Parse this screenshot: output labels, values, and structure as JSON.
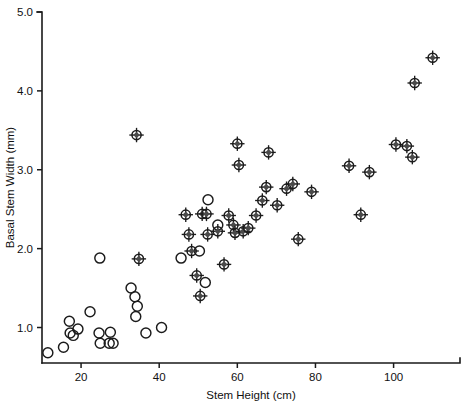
{
  "chart_data": {
    "type": "scatter",
    "title": "",
    "xlabel": "Stem Height (cm)",
    "ylabel": "Basal Stem Width (mm)",
    "xlim": [
      10,
      117
    ],
    "ylim": [
      0.55,
      5.0
    ],
    "xticks": [
      20,
      40,
      60,
      80,
      100
    ],
    "xtick_labels": [
      "20",
      "40",
      "60",
      "80",
      "100"
    ],
    "yticks": [
      1.0,
      2.0,
      3.0,
      4.0,
      5.0
    ],
    "ytick_labels": [
      "1.0",
      "2.0",
      "3.0",
      "4.0",
      "5.0"
    ],
    "grid": false,
    "legend": "none",
    "series": [
      {
        "name": "open-circle",
        "marker": "open circle",
        "points": [
          [
            11.5,
            0.68
          ],
          [
            15.5,
            0.75
          ],
          [
            17.0,
            1.08
          ],
          [
            17.2,
            0.93
          ],
          [
            18.0,
            0.9
          ],
          [
            19.2,
            0.98
          ],
          [
            22.3,
            1.2
          ],
          [
            24.6,
            0.93
          ],
          [
            24.8,
            1.88
          ],
          [
            24.9,
            0.8
          ],
          [
            27.2,
            0.8
          ],
          [
            27.5,
            0.94
          ],
          [
            28.2,
            0.8
          ],
          [
            32.8,
            1.5
          ],
          [
            33.8,
            1.39
          ],
          [
            34.0,
            1.14
          ],
          [
            34.4,
            1.27
          ],
          [
            36.6,
            0.93
          ],
          [
            40.6,
            1.0
          ],
          [
            45.6,
            1.88
          ],
          [
            50.3,
            1.97
          ],
          [
            51.8,
            1.57
          ],
          [
            52.5,
            2.62
          ],
          [
            55.0,
            2.3
          ]
        ]
      },
      {
        "name": "crosshair-circle",
        "marker": "circle with cross",
        "points": [
          [
            34.2,
            3.44
          ],
          [
            34.8,
            1.87
          ],
          [
            46.8,
            2.43
          ],
          [
            47.6,
            2.18
          ],
          [
            48.3,
            1.97
          ],
          [
            49.6,
            1.66
          ],
          [
            50.5,
            1.4
          ],
          [
            51.0,
            2.44
          ],
          [
            52.1,
            2.44
          ],
          [
            52.4,
            2.18
          ],
          [
            55.0,
            2.22
          ],
          [
            56.6,
            1.8
          ],
          [
            57.8,
            2.42
          ],
          [
            59.0,
            2.3
          ],
          [
            59.4,
            2.2
          ],
          [
            60.0,
            3.33
          ],
          [
            60.4,
            3.06
          ],
          [
            61.5,
            2.22
          ],
          [
            62.8,
            2.26
          ],
          [
            64.8,
            2.42
          ],
          [
            66.4,
            2.61
          ],
          [
            67.4,
            2.78
          ],
          [
            68.0,
            3.22
          ],
          [
            70.2,
            2.55
          ],
          [
            72.6,
            2.76
          ],
          [
            74.2,
            2.82
          ],
          [
            75.6,
            2.12
          ],
          [
            79.0,
            2.72
          ],
          [
            88.6,
            3.05
          ],
          [
            91.6,
            2.43
          ],
          [
            93.8,
            2.97
          ],
          [
            100.6,
            3.32
          ],
          [
            103.4,
            3.3
          ],
          [
            104.8,
            3.16
          ],
          [
            105.4,
            4.1
          ],
          [
            110.0,
            4.42
          ]
        ]
      }
    ]
  },
  "figure": {
    "axes": {
      "left_px": 42,
      "right_px": 460,
      "top_px": 12,
      "bottom_px": 363
    }
  }
}
